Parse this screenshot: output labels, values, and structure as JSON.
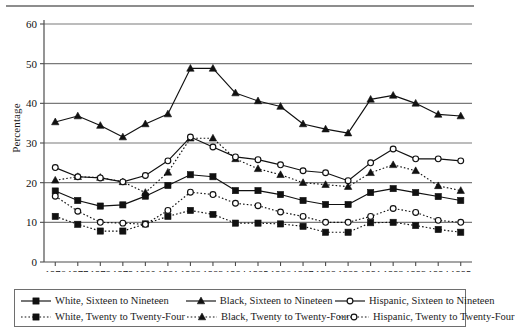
{
  "figure": {
    "ylabel": "Percentage",
    "has_top_rule": true
  },
  "chart_data": {
    "type": "line",
    "title": "",
    "xlabel": "",
    "ylabel": "Percentage",
    "ylim": [
      0,
      60
    ],
    "yticks": [
      0,
      10,
      20,
      30,
      40,
      50,
      60
    ],
    "grid": "horizontal",
    "legend_position": "bottom",
    "categories": [
      "1976",
      "1977",
      "1978",
      "1979",
      "1980",
      "1981",
      "1982",
      "1983",
      "1984",
      "1985",
      "1986",
      "1987",
      "1988",
      "1989",
      "1991",
      "1992",
      "1993",
      "1994",
      "1995"
    ],
    "series": [
      {
        "name": "White, Sixteen to Nineteen",
        "marker": "filled-square",
        "line": "solid",
        "values": [
          17.9,
          15.5,
          14.1,
          14.4,
          16.6,
          19.3,
          22.0,
          21.5,
          18.0,
          18.0,
          17.0,
          15.5,
          14.5,
          14.5,
          17.5,
          18.5,
          17.5,
          16.5,
          15.5
        ]
      },
      {
        "name": "White, Twenty to Twenty-Four",
        "marker": "filled-square",
        "line": "dotted",
        "values": [
          11.5,
          9.5,
          7.8,
          7.8,
          9.6,
          11.5,
          13.0,
          12.0,
          9.8,
          9.8,
          9.6,
          9.0,
          7.5,
          7.5,
          9.9,
          10.0,
          9.2,
          8.2,
          7.5
        ]
      },
      {
        "name": "Black, Sixteen to Nineteen",
        "marker": "filled-triangle",
        "line": "solid",
        "values": [
          35.3,
          36.8,
          34.4,
          31.5,
          34.8,
          37.3,
          48.8,
          48.8,
          42.6,
          40.6,
          39.2,
          34.8,
          33.5,
          32.5,
          41.0,
          42.0,
          40.0,
          37.2,
          36.8
        ]
      },
      {
        "name": "Black, Twenty to Twenty-Four",
        "marker": "filled-triangle",
        "line": "dotted",
        "values": [
          20.6,
          21.5,
          21.3,
          20.2,
          17.5,
          22.6,
          31.2,
          31.2,
          26.0,
          23.5,
          22.0,
          20.0,
          19.5,
          19.0,
          22.5,
          24.5,
          23.0,
          19.2,
          18.0
        ]
      },
      {
        "name": "Hispanic, Sixteen to Nineteen",
        "marker": "open-circle",
        "line": "solid",
        "values": [
          23.8,
          21.5,
          21.2,
          20.2,
          21.8,
          25.5,
          31.5,
          29.0,
          26.5,
          25.8,
          24.5,
          23.0,
          22.5,
          20.5,
          25.0,
          28.5,
          26.0,
          26.0,
          25.5
        ]
      },
      {
        "name": "Hispanic, Twenty to Twenty-Four",
        "marker": "open-circle",
        "line": "dotted",
        "values": [
          16.6,
          12.8,
          10.0,
          9.8,
          9.5,
          13.0,
          17.6,
          17.0,
          14.8,
          14.2,
          12.6,
          11.5,
          10.0,
          10.0,
          11.5,
          13.5,
          12.5,
          10.5,
          10.0
        ]
      }
    ]
  },
  "legend": {
    "rows": [
      [
        {
          "label": "White, Sixteen to Nineteen",
          "marker": "filled-square",
          "line": "solid"
        },
        {
          "label": "Black, Sixteen to Nineteen",
          "marker": "filled-triangle",
          "line": "solid"
        },
        {
          "label": "Hispanic, Sixteen to Nineteen",
          "marker": "open-circle",
          "line": "solid"
        }
      ],
      [
        {
          "label": "White, Twenty to Twenty-Four",
          "marker": "filled-square",
          "line": "dotted"
        },
        {
          "label": "Black, Twenty to Twenty-Four",
          "marker": "filled-triangle",
          "line": "dotted"
        },
        {
          "label": "Hispanic, Twenty to Twenty-Four",
          "marker": "open-circle",
          "line": "dotted"
        }
      ]
    ]
  },
  "colors": {
    "ink": "#111111",
    "gridline": "#7a7a7a",
    "axis": "#4d4d4d",
    "rule": "#8d8d8d",
    "background": "#ffffff"
  }
}
